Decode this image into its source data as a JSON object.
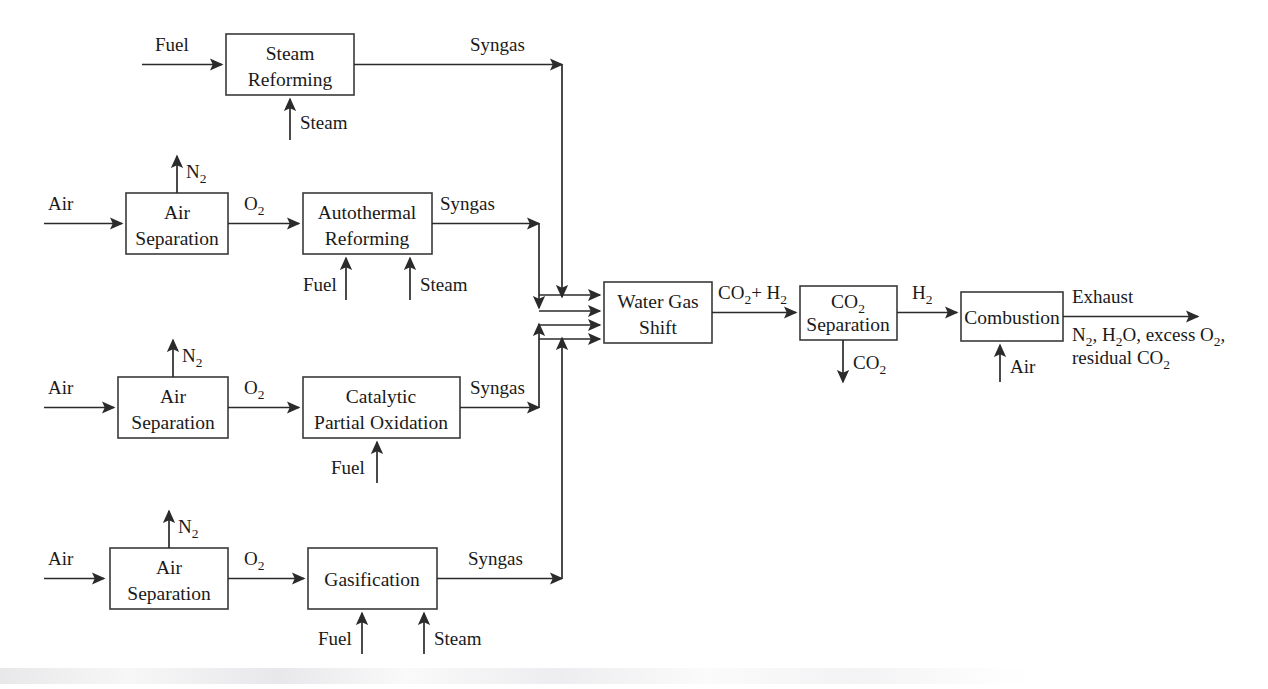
{
  "diagram": {
    "colors": {
      "line": "#2b2b2b",
      "box_stroke": "#3a3a3a",
      "box_fill": "#ffffff",
      "text": "#1a1a1a",
      "background": "#ffffff"
    },
    "boxes": [
      {
        "id": "steam-reforming",
        "lines": [
          "Steam",
          "Reforming"
        ]
      },
      {
        "id": "air-separation-1",
        "lines": [
          "Air",
          "Separation"
        ]
      },
      {
        "id": "autothermal-reforming",
        "lines": [
          "Autothermal",
          "Reforming"
        ]
      },
      {
        "id": "air-separation-2",
        "lines": [
          "Air",
          "Separation"
        ]
      },
      {
        "id": "catalytic-partial-oxidation",
        "lines": [
          "Catalytic",
          "Partial Oxidation"
        ]
      },
      {
        "id": "air-separation-3",
        "lines": [
          "Air",
          "Separation"
        ]
      },
      {
        "id": "gasification",
        "lines": [
          "Gasification"
        ]
      },
      {
        "id": "water-gas-shift",
        "lines": [
          "Water Gas",
          "Shift"
        ]
      },
      {
        "id": "co2-separation",
        "lines": [
          "CO2",
          "Separation"
        ]
      },
      {
        "id": "combustion",
        "lines": [
          "Combustion"
        ]
      }
    ],
    "labels": {
      "fuel": "Fuel",
      "steam": "Steam",
      "air": "Air",
      "nitrogen": "N2",
      "oxygen": "O2",
      "syngas": "Syngas",
      "co2_plus_h2": "CO2+ H2",
      "co2": "CO2",
      "h2": "H2",
      "exhaust": "Exhaust",
      "exhaust_detail_line1": "N2, H2O, excess O2,",
      "exhaust_detail_line2": "residual CO2"
    },
    "rows": [
      {
        "id": "row-steam-reforming",
        "inputs": [
          "Fuel",
          "Steam"
        ],
        "process": "Steam Reforming",
        "output": "Syngas"
      },
      {
        "id": "row-autothermal-reforming",
        "inputs": [
          "Air",
          "Fuel",
          "Steam"
        ],
        "byproduct": "N2",
        "intermediate": "O2",
        "process": [
          "Air Separation",
          "Autothermal Reforming"
        ],
        "output": "Syngas"
      },
      {
        "id": "row-catalytic-partial-oxidation",
        "inputs": [
          "Air",
          "Fuel"
        ],
        "byproduct": "N2",
        "intermediate": "O2",
        "process": [
          "Air Separation",
          "Catalytic Partial Oxidation"
        ],
        "output": "Syngas"
      },
      {
        "id": "row-gasification",
        "inputs": [
          "Air",
          "Fuel",
          "Steam"
        ],
        "byproduct": "N2",
        "intermediate": "O2",
        "process": [
          "Air Separation",
          "Gasification"
        ],
        "output": "Syngas"
      }
    ],
    "downstream": {
      "stages": [
        "Water Gas Shift",
        "CO2 Separation",
        "Combustion"
      ],
      "streams": [
        "CO2+ H2",
        "CO2",
        "H2",
        "Air",
        "Exhaust"
      ]
    }
  }
}
